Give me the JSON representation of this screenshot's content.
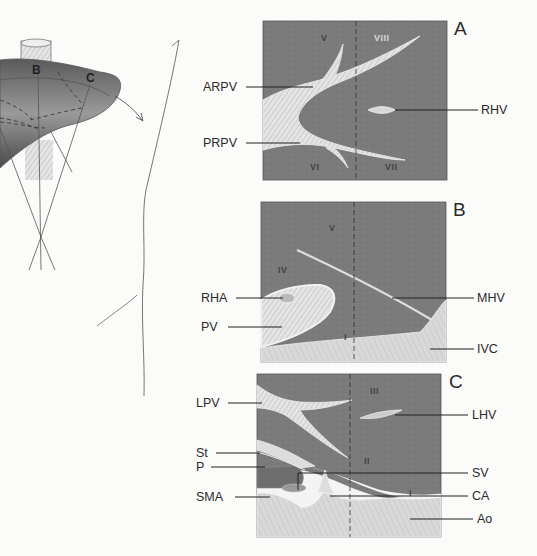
{
  "figure": {
    "overview": {
      "plane_labels": [
        "B",
        "C"
      ]
    },
    "panels": [
      {
        "id": "A",
        "segments": [
          "V",
          "VIII",
          "VI",
          "VII"
        ],
        "left_labels": [
          "ARPV",
          "PRPV"
        ],
        "right_labels": [
          "RHV"
        ]
      },
      {
        "id": "B",
        "segments": [
          "V",
          "IV",
          "I"
        ],
        "left_labels": [
          "RHA",
          "PV"
        ],
        "right_labels": [
          "MHV",
          "IVC"
        ]
      },
      {
        "id": "C",
        "segments": [
          "III",
          "II",
          "I"
        ],
        "left_labels": [
          "LPV",
          "St",
          "P",
          "SMA"
        ],
        "right_labels": [
          "LHV",
          "SV",
          "CA",
          "Ao"
        ]
      }
    ]
  },
  "colors": {
    "background": "#fbfbfa",
    "liver_parenchyma": "#7d7d7d",
    "vessel_fill": "#cfcfcf",
    "retroperitoneum": "#dcdcdc",
    "line": "#333333"
  }
}
